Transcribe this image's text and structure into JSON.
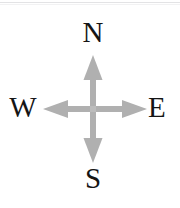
{
  "figure": {
    "width": 180,
    "height": 208,
    "background_color": "#ffffff",
    "rule_color": "#e3e3e5"
  },
  "compass": {
    "arrow_color": "#b0b0b0",
    "label_color": "#151515",
    "center": {
      "x": 93,
      "y": 109
    },
    "directions": [
      {
        "key": "north",
        "label": "N",
        "icon": "arrow-up-icon",
        "tip": {
          "x": 93,
          "y": 55
        }
      },
      {
        "key": "east",
        "label": "E",
        "icon": "arrow-right-icon",
        "tip": {
          "x": 147,
          "y": 109
        }
      },
      {
        "key": "south",
        "label": "S",
        "icon": "arrow-down-icon",
        "tip": {
          "x": 93,
          "y": 163
        }
      },
      {
        "key": "west",
        "label": "W",
        "icon": "arrow-left-icon",
        "tip": {
          "x": 43,
          "y": 109
        }
      }
    ]
  },
  "labels": {
    "north": "N",
    "east": "E",
    "south": "S",
    "west": "W"
  }
}
